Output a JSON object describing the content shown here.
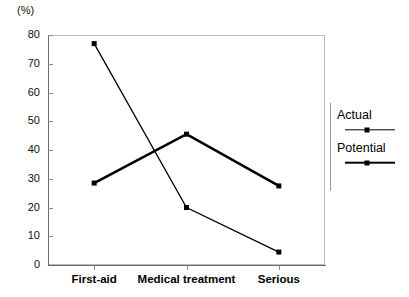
{
  "chart_data": {
    "type": "line",
    "title": "",
    "xlabel": "",
    "ylabel": "(%)",
    "unit_label": "(%)",
    "categories": [
      "First-aid",
      "Medical treatment",
      "Serious"
    ],
    "series": [
      {
        "name": "Actual",
        "values": [
          77,
          20,
          4.5
        ],
        "line_weight": "thin",
        "marker": "square",
        "color": "#000000"
      },
      {
        "name": "Potential",
        "values": [
          28.5,
          45.5,
          27.5
        ],
        "line_weight": "thick",
        "marker": "square",
        "color": "#000000"
      }
    ],
    "ylim": [
      0,
      80
    ],
    "yticks": [
      0,
      10,
      20,
      30,
      40,
      50,
      60,
      70,
      80
    ],
    "ytick_labels": [
      "0",
      "10",
      "20",
      "30",
      "40",
      "50",
      "60",
      "70",
      "80"
    ],
    "grid": false,
    "legend_position": "right"
  },
  "legend": {
    "entries": [
      {
        "label": "Actual"
      },
      {
        "label": "Potential"
      }
    ]
  }
}
